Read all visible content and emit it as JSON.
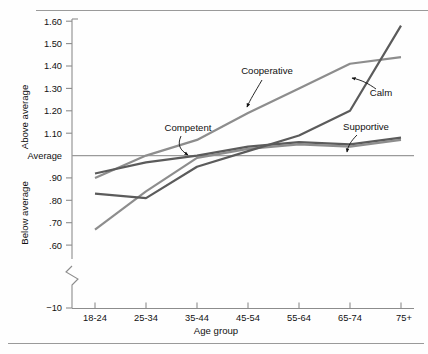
{
  "chart_data": {
    "type": "line",
    "title": "",
    "xlabel": "Age group",
    "ylabel": "",
    "categories": [
      "18-24",
      "25-34",
      "35-44",
      "45-54",
      "55-64",
      "65-74",
      "75+"
    ],
    "ylim": [
      0.6,
      1.6
    ],
    "ytick_values": [
      1.6,
      1.5,
      1.4,
      1.3,
      1.2,
      1.1,
      1.0,
      0.9,
      0.8,
      0.7,
      0.6
    ],
    "ytick_labels": [
      "1.60",
      "1.50",
      "1.40",
      "1.30",
      "1.20",
      "1.10",
      "Average",
      ".90",
      ".80",
      ".70",
      ".60"
    ],
    "axis_break": true,
    "axis_origin_label": "−10",
    "upper_region_label": "Above average",
    "lower_region_label": "Below average",
    "reference_line": {
      "value": 1.0,
      "label": "Average"
    },
    "grid": false,
    "legend_position": "inline-annotations",
    "series": [
      {
        "name": "Cooperative",
        "color": "#8d8d8d",
        "values": [
          0.9,
          1.0,
          1.07,
          1.19,
          1.3,
          1.41,
          1.44
        ]
      },
      {
        "name": "Calm",
        "color": "#5b5b5b",
        "values": [
          0.83,
          0.81,
          0.95,
          1.02,
          1.09,
          1.2,
          1.58
        ]
      },
      {
        "name": "Supportive",
        "color": "#5b5b5b",
        "values": [
          0.92,
          0.97,
          1.0,
          1.04,
          1.06,
          1.05,
          1.08
        ]
      },
      {
        "name": "Competent",
        "color": "#8d8d8d",
        "values": [
          0.67,
          0.84,
          0.99,
          1.03,
          1.05,
          1.04,
          1.07
        ]
      }
    ],
    "annotations": [
      {
        "text": "Cooperative",
        "x": 267,
        "y": 71
      },
      {
        "text": "Calm",
        "x": 379,
        "y": 92
      },
      {
        "text": "Competent",
        "x": 189,
        "y": 128
      },
      {
        "text": "Supportive",
        "x": 362,
        "y": 127
      }
    ]
  }
}
